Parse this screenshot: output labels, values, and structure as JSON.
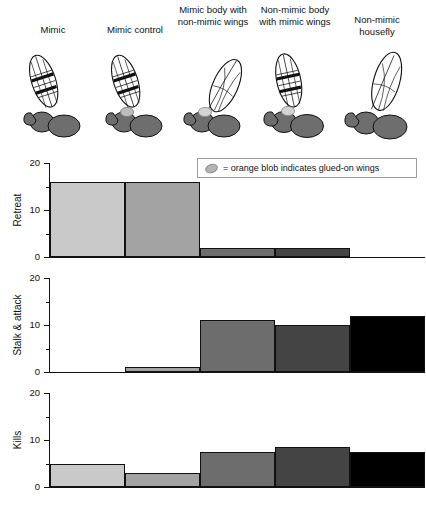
{
  "specimens": [
    {
      "label": "Mimic",
      "wings": "banded",
      "blob": false
    },
    {
      "label": "Mimic control",
      "wings": "banded",
      "blob": true
    },
    {
      "label": "Mimic body with non-mimic wings",
      "wings": "clear",
      "blob": true
    },
    {
      "label": "Non-mimic body with mimic wings",
      "wings": "banded",
      "blob": true
    },
    {
      "label": "Non-mimic housefly",
      "wings": "clear",
      "blob": false
    }
  ],
  "legend": {
    "icon": "orange-blob-icon",
    "text": "= orange blob indicates glued-on wings"
  },
  "colors": {
    "bar1": "#c9c9c9",
    "bar2": "#a3a3a3",
    "bar3": "#6d6d6d",
    "bar4": "#444444",
    "bar5": "#000000",
    "body": "#6e6e6e",
    "axis": "#111111"
  },
  "chart_data": [
    {
      "type": "bar",
      "title": "",
      "ylabel": "Retreat",
      "xlabel": "",
      "categories": [
        "Mimic",
        "Mimic control",
        "Mimic body with non-mimic wings",
        "Non-mimic body with mimic wings",
        "Non-mimic housefly"
      ],
      "values": [
        16,
        16,
        2,
        2,
        0
      ],
      "ylim": [
        0,
        20
      ],
      "yticks": [
        0,
        10,
        20
      ],
      "yticks_minor": [
        5,
        15
      ],
      "grid": false,
      "legend_position": "top-right"
    },
    {
      "type": "bar",
      "title": "",
      "ylabel": "Stalk & attack",
      "xlabel": "",
      "categories": [
        "Mimic",
        "Mimic control",
        "Mimic body with non-mimic wings",
        "Non-mimic body with mimic wings",
        "Non-mimic housefly"
      ],
      "values": [
        0,
        1,
        11,
        10,
        12
      ],
      "ylim": [
        0,
        20
      ],
      "yticks": [
        0,
        10,
        20
      ],
      "yticks_minor": [
        5,
        15
      ],
      "grid": false,
      "legend_position": "none"
    },
    {
      "type": "bar",
      "title": "",
      "ylabel": "Kills",
      "xlabel": "",
      "categories": [
        "Mimic",
        "Mimic control",
        "Mimic body with non-mimic wings",
        "Non-mimic body with mimic wings",
        "Non-mimic housefly"
      ],
      "values": [
        5,
        3,
        7.5,
        8.5,
        7.5
      ],
      "ylim": [
        0,
        20
      ],
      "yticks": [
        0,
        10,
        20
      ],
      "yticks_minor": [
        5,
        15
      ],
      "grid": false,
      "legend_position": "none"
    }
  ],
  "axis_labels": {
    "t20": "20",
    "t10": "10",
    "t0": "0"
  }
}
